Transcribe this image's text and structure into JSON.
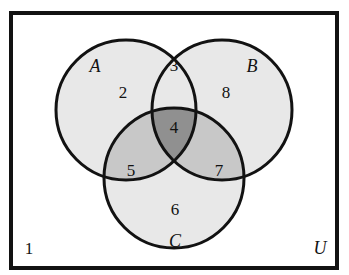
{
  "figure": {
    "background_color": "#ffffff"
  },
  "chart_data": {
    "type": "diagram",
    "diagram_type": "venn",
    "set_count": 3,
    "title": "",
    "universe_label": "U",
    "sets": [
      {
        "name": "A",
        "label": "A",
        "cx": 126,
        "cy": 110,
        "r": 70
      },
      {
        "name": "B",
        "label": "B",
        "cx": 222,
        "cy": 110,
        "r": 70
      },
      {
        "name": "C",
        "label": "C",
        "cx": 174,
        "cy": 178,
        "r": 70
      }
    ],
    "regions": [
      {
        "id": 1,
        "label": "1",
        "membership": "none",
        "description": "outside all sets (universe only)",
        "fill": "#ffffff",
        "x": 29,
        "y": 248
      },
      {
        "id": 2,
        "label": "2",
        "membership": "A",
        "description": "A only",
        "fill": "#e8e8e8",
        "x": 123,
        "y": 92
      },
      {
        "id": 3,
        "label": "3",
        "membership": "AB",
        "description": "A and B only",
        "fill": "#e8e8e8",
        "x": 174,
        "y": 65
      },
      {
        "id": 4,
        "label": "4",
        "membership": "ABC",
        "description": "A and B and C",
        "fill": "#909090",
        "x": 174,
        "y": 127
      },
      {
        "id": 5,
        "label": "5",
        "membership": "AC",
        "description": "A and C only",
        "fill": "#c8c8c8",
        "x": 131,
        "y": 170
      },
      {
        "id": 6,
        "label": "6",
        "membership": "C",
        "description": "C only",
        "fill": "#e8e8e8",
        "x": 175,
        "y": 209
      },
      {
        "id": 7,
        "label": "7",
        "membership": "BC",
        "description": "B and C only",
        "fill": "#c8c8c8",
        "x": 219,
        "y": 170
      },
      {
        "id": 8,
        "label": "8",
        "membership": "B",
        "description": "B only",
        "fill": "#e8e8e8",
        "x": 226,
        "y": 92
      }
    ],
    "set_label_positions": [
      {
        "label": "A",
        "x": 95,
        "y": 66
      },
      {
        "label": "B",
        "x": 252,
        "y": 66
      },
      {
        "label": "C",
        "x": 175,
        "y": 241
      },
      {
        "label": "U",
        "x": 320,
        "y": 248
      }
    ],
    "universe_rect": {
      "x": 11,
      "y": 13,
      "width": 326,
      "height": 255
    },
    "colors": {
      "outline": "#121212",
      "text": "#121212",
      "fill_single": "#e8e8e8",
      "fill_pair_light": "#e8e8e8",
      "fill_pair_medium": "#c8c8c8",
      "fill_triple": "#909090",
      "universe_fill": "#ffffff"
    },
    "stroke_widths": {
      "rect": 4,
      "circle": 3
    }
  }
}
